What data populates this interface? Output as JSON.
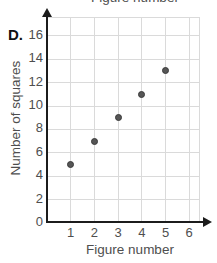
{
  "panel_label": "D.",
  "cropped_title_above": "Figure number",
  "chart_data": {
    "type": "scatter",
    "title": "",
    "xlabel": "Figure number",
    "ylabel": "Number of squares",
    "x_ticks": [
      1,
      2,
      3,
      4,
      5,
      6
    ],
    "y_ticks": [
      0,
      2,
      4,
      6,
      8,
      10,
      12,
      14,
      16
    ],
    "xlim": [
      0,
      6.4
    ],
    "ylim": [
      0,
      17.5
    ],
    "grid": true,
    "points": [
      [
        1,
        5
      ],
      [
        2,
        7
      ],
      [
        3,
        9
      ],
      [
        4,
        11
      ],
      [
        5,
        13
      ]
    ],
    "colors": {
      "point_fill": "#565656",
      "point_border": "#3a3a3a",
      "grid": "#dadada",
      "axis": "#1c1c1c",
      "text": "#4e4e4e"
    }
  }
}
